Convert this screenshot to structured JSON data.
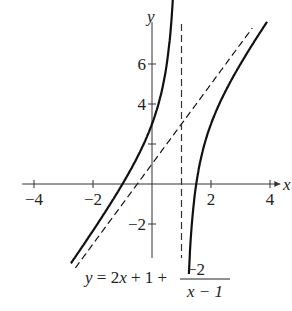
{
  "chart_data": {
    "type": "line",
    "title": "",
    "equation": {
      "lhs": "y = 2x + 1 + ",
      "numerator": "−2",
      "denominator": "x − 1"
    },
    "xlabel": "x",
    "ylabel": "y",
    "xlim": [
      -4.3,
      4.3
    ],
    "ylim": [
      -3.8,
      7.8
    ],
    "x_ticks": [
      {
        "v": -4,
        "label": "−4"
      },
      {
        "v": -2,
        "label": "−2"
      },
      {
        "v": 2,
        "label": "2"
      },
      {
        "v": 4,
        "label": "4"
      }
    ],
    "y_ticks": [
      {
        "v": -2,
        "label": "−2"
      },
      {
        "v": 2,
        "label": ""
      },
      {
        "v": 4,
        "label": "4"
      },
      {
        "v": 6,
        "label": "6"
      }
    ],
    "grid": false,
    "series": [
      {
        "name": "y = 2x + 1 − 2/(x−1)",
        "style": "solid",
        "branch": "left",
        "x_range": [
          -2.75,
          0.72
        ]
      },
      {
        "name": "y = 2x + 1 − 2/(x−1)",
        "style": "solid",
        "branch": "right",
        "x_range": [
          1.25,
          3.9
        ]
      },
      {
        "name": "oblique asymptote y = 2x + 1",
        "style": "dashed",
        "x_range": [
          -2.6,
          3.4
        ]
      },
      {
        "name": "vertical asymptote x = 1",
        "style": "dashed",
        "x": 1
      }
    ],
    "colors": {
      "curve": "#111111",
      "axes": "#333333"
    }
  }
}
